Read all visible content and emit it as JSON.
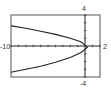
{
  "chart_data": {
    "type": "line",
    "title": "",
    "xlabel": "",
    "ylabel": "",
    "xlim": [
      -10,
      2
    ],
    "ylim": [
      -4,
      4
    ],
    "x_tick_step": 1,
    "y_tick_step": 1,
    "grid": false,
    "tick_labels": {
      "x_min": "-10",
      "x_max": "2",
      "y_max": "4",
      "y_min": "-4"
    },
    "series": [
      {
        "name": "curve",
        "description": "Sideways parabola opening left, vertex near origin",
        "points": [
          {
            "x": -10,
            "y": 2.6
          },
          {
            "x": -8,
            "y": 2.3
          },
          {
            "x": -6,
            "y": 1.9
          },
          {
            "x": -4,
            "y": 1.5
          },
          {
            "x": -2,
            "y": 1.0
          },
          {
            "x": -0.5,
            "y": 0.5
          },
          {
            "x": 0.3,
            "y": -0.15
          },
          {
            "x": -0.5,
            "y": -0.8
          },
          {
            "x": -2,
            "y": -1.5
          },
          {
            "x": -4,
            "y": -2.1
          },
          {
            "x": -6,
            "y": -2.6
          },
          {
            "x": -8,
            "y": -3.0
          },
          {
            "x": -10,
            "y": -3.4
          }
        ]
      }
    ]
  },
  "labels": {
    "x_min": "-10",
    "x_max": "2",
    "y_max": "4",
    "y_min": "-4"
  },
  "colors": {
    "axis": "#222222",
    "curve": "#222222",
    "frame": "#444444",
    "background": "#ffffff"
  }
}
